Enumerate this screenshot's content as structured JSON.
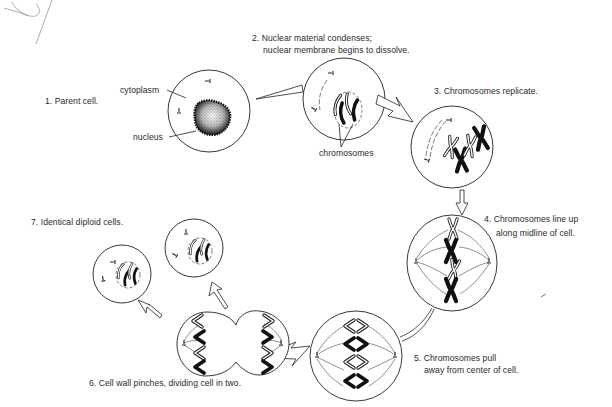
{
  "colors": {
    "ink": "#222222",
    "background": "#ffffff",
    "stipple": "#333333"
  },
  "stages": [
    {
      "number": 1,
      "text": "1. Parent cell.",
      "lines": [
        "1. Parent cell."
      ]
    },
    {
      "number": 2,
      "text": "2. Nuclear material condenses; nuclear membrane begins to dissolve.",
      "lines": [
        "2. Nuclear material condenses;",
        "nuclear membrane begins to dissolve."
      ]
    },
    {
      "number": 3,
      "text": "3. Chromosomes replicate.",
      "lines": [
        "3. Chromosomes replicate."
      ]
    },
    {
      "number": 4,
      "text": "4. Chromosomes line up along midline of cell.",
      "lines": [
        "4. Chromosomes line up",
        "along midline of cell."
      ]
    },
    {
      "number": 5,
      "text": "5. Chromosomes pull away from center of cell.",
      "lines": [
        "5. Chromosomes pull",
        "away from center of cell."
      ]
    },
    {
      "number": 6,
      "text": "6. Cell wall pinches, dividing cell in two.",
      "lines": [
        "6. Cell wall pinches, dividing cell in two."
      ]
    },
    {
      "number": 7,
      "text": "7. Identical diploid cells.",
      "lines": [
        "7. Identical diploid cells."
      ]
    }
  ],
  "callouts": {
    "cytoplasm": "cytoplasm",
    "nucleus": "nucleus",
    "chromosomes": "chromosomes"
  }
}
